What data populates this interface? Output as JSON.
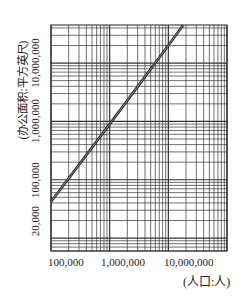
{
  "chart_data": {
    "type": "line",
    "title": "",
    "xlabel": "(人口:人)",
    "ylabel": "(办公面积:平方英尺)",
    "xscale": "log",
    "yscale": "log",
    "xlim": [
      100000,
      100000000
    ],
    "ylim": [
      6000,
      45000000
    ],
    "x_ticks": [
      {
        "value": 100000,
        "label": "100,000"
      },
      {
        "value": 1000000,
        "label": "1,000,000"
      },
      {
        "value": 10000000,
        "label": "10,000,000"
      }
    ],
    "y_ticks": [
      {
        "value": 20000,
        "label": "20,000"
      },
      {
        "value": 100000,
        "label": "100,000"
      },
      {
        "value": 1000000,
        "label": "1,000,000"
      },
      {
        "value": 10000000,
        "label": "10,000,000"
      }
    ],
    "grid": "log-log dense",
    "series": [
      {
        "name": "office area vs population",
        "x": [
          100000,
          1000000,
          10000000,
          18000000
        ],
        "y": [
          42000,
          900000,
          20000000,
          45000000
        ]
      }
    ]
  },
  "labels": {
    "xlabel": "(人口:人)",
    "ylabel": "(办公面积:平方英尺)",
    "x_ticks": [
      "100,000",
      "1,000,000",
      "10,000,000"
    ],
    "y_ticks": [
      "10,000,000",
      "1,000,000",
      "100,000",
      "20,000"
    ]
  }
}
